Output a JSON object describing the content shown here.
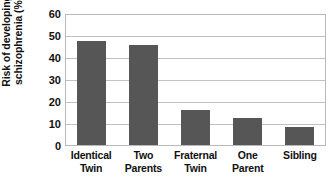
{
  "chart_data": {
    "type": "bar",
    "title": "",
    "xlabel": "",
    "ylabel": "Risk of developing schizophrenia (%)",
    "ylabel_lines": [
      "Risk of developing",
      "schizophrenia (%)"
    ],
    "categories": [
      "Identical Twin",
      "Two Parents",
      "Fraternal Twin",
      "One Parent",
      "Sibling"
    ],
    "category_lines": [
      [
        "Identical",
        "Twin"
      ],
      [
        "Two",
        "Parents"
      ],
      [
        "Fraternal",
        "Twin"
      ],
      [
        "One",
        "Parent"
      ],
      [
        "Sibling"
      ]
    ],
    "values": [
      48,
      46,
      16,
      12.5,
      8.5
    ],
    "ylim": [
      0,
      60
    ],
    "ytick_values": [
      60,
      50,
      40,
      30,
      20,
      10,
      0
    ],
    "ytick_labels": [
      "60",
      "50",
      "40",
      "30",
      "20",
      "10",
      "0"
    ],
    "grid": true,
    "legend": false,
    "legend_position": "none",
    "bar_color": "#565656",
    "plot_border_color": "#b9b9b9",
    "gridline_color": "#c2c2c2",
    "text_color": "#111111",
    "background_color": "#ffffff"
  }
}
